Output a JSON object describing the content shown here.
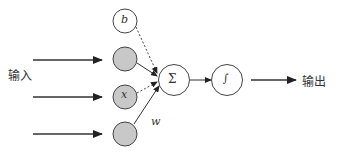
{
  "labels": {
    "input": "输入",
    "output": "输出",
    "bias": "b",
    "x": "x",
    "weight": "w",
    "sum": "Σ",
    "activation": "∫"
  },
  "colors": {
    "stroke": "#333333",
    "input_fill": "#c8c8c8",
    "node_fill": "#ffffff"
  }
}
